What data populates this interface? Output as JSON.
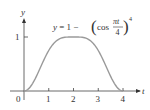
{
  "chart_data": {
    "type": "line",
    "title": "",
    "annotation": {
      "lhs": "y = 1 − ",
      "func": "cos",
      "numerator": "πt",
      "denominator": "4",
      "exponent": "4"
    },
    "xlabel": "t",
    "ylabel": "y",
    "x_ticks": [
      "0",
      "1",
      "2",
      "3",
      "4"
    ],
    "y_ticks": [
      "1"
    ],
    "xlim": [
      0,
      4
    ],
    "ylim": [
      0,
      1
    ],
    "grid": false,
    "series": [
      {
        "name": "y = 1 - (cos(πt/4))^4",
        "x": [
          0,
          0.25,
          0.5,
          0.75,
          1,
          1.25,
          1.5,
          1.75,
          2,
          2.25,
          2.5,
          2.75,
          3,
          3.25,
          3.5,
          3.75,
          4
        ],
        "values": [
          0,
          0.037,
          0.271,
          0.471,
          0.75,
          0.906,
          0.979,
          0.998,
          1,
          0.998,
          0.979,
          0.906,
          0.75,
          0.471,
          0.271,
          0.037,
          0
        ],
        "color": "#9a9a9a"
      }
    ]
  },
  "colors": {
    "curve": "#9a9a9a",
    "axis": "#333333"
  }
}
